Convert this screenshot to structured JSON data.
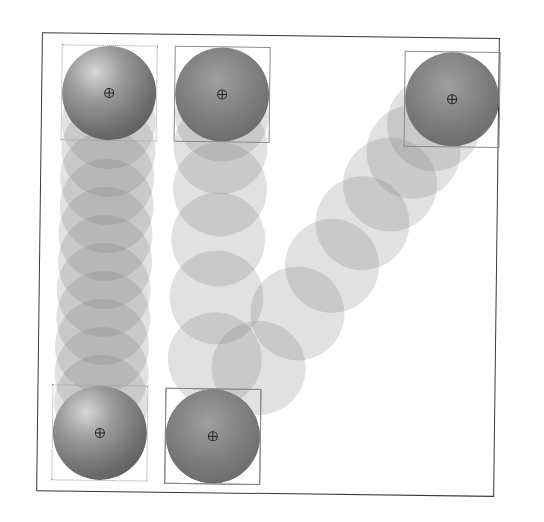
{
  "diagram": {
    "title": "",
    "colors": {
      "frame_border": "#3a3a3a",
      "bbox_border": "#8a8a8a",
      "ghost_fill": "rgba(120,120,120,0.22)",
      "sphere_dark": "#4e4e4e",
      "sphere_light": "#d8d8d8"
    },
    "sphere_radius": 47,
    "paths": [
      {
        "name": "linear-vertical",
        "start": {
          "x": 107,
          "y": 95,
          "bbox": "dotted",
          "shading": "highlight"
        },
        "end": {
          "x": 102,
          "y": 435,
          "bbox": "dotted",
          "shading": "highlight"
        },
        "ghost_centers": [
          [
            107,
            124
          ],
          [
            107,
            152
          ],
          [
            106,
            180
          ],
          [
            106,
            208
          ],
          [
            105,
            236
          ],
          [
            105,
            264
          ],
          [
            104,
            292
          ],
          [
            104,
            320
          ],
          [
            103,
            348
          ],
          [
            103,
            376
          ],
          [
            103,
            404
          ]
        ]
      },
      {
        "name": "eased-vertical",
        "start": {
          "x": 220,
          "y": 95,
          "bbox": "solid",
          "shading": "flat"
        },
        "end": {
          "x": 215,
          "y": 437,
          "bbox": "solid",
          "shading": "flat"
        },
        "ghost_centers": [
          [
            220,
            115
          ],
          [
            219,
            148
          ],
          [
            219,
            190
          ],
          [
            218,
            240
          ],
          [
            217,
            298
          ],
          [
            216,
            360
          ]
        ]
      },
      {
        "name": "diagonal",
        "start": {
          "x": 450,
          "y": 97,
          "bbox": "solid",
          "shading": "flat"
        },
        "end": {
          "x": 215,
          "y": 437,
          "bbox": "solid",
          "shading": "flat"
        },
        "ghost_centers": [
          [
            432,
            122
          ],
          [
            412,
            150
          ],
          [
            389,
            183
          ],
          [
            362,
            222
          ],
          [
            332,
            265
          ],
          [
            298,
            313
          ],
          [
            260,
            368
          ]
        ]
      }
    ]
  }
}
